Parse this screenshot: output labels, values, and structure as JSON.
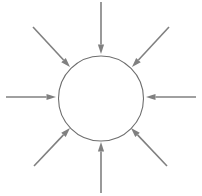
{
  "diagram": {
    "canvas": {
      "width": 202,
      "height": 196,
      "background": "#ffffff"
    },
    "colors": {
      "arrow": "#808080",
      "circle_stroke": "#6e6e6e",
      "background": "#ffffff"
    },
    "circle": {
      "label": "central circle",
      "cx": 101,
      "cy": 98.5,
      "r": 42.5,
      "stroke_width": 1.1,
      "fill": "none"
    },
    "arrow_count": 8,
    "arrows": [
      {
        "name": "arrow-north",
        "direction": "down",
        "compass": "N",
        "angle_deg": 90,
        "tail": {
          "x": 101,
          "y": 2
        },
        "tip": {
          "x": 101,
          "y": 54
        }
      },
      {
        "name": "arrow-northeast",
        "direction": "down-left",
        "compass": "NE",
        "angle_deg": 45,
        "tail": {
          "x": 169,
          "y": 27
        },
        "tip": {
          "x": 132,
          "y": 67
        }
      },
      {
        "name": "arrow-east",
        "direction": "left",
        "compass": "E",
        "angle_deg": 0,
        "tail": {
          "x": 196,
          "y": 97
        },
        "tip": {
          "x": 146,
          "y": 97
        }
      },
      {
        "name": "arrow-southeast",
        "direction": "up-left",
        "compass": "SE",
        "angle_deg": 315,
        "tail": {
          "x": 167,
          "y": 166
        },
        "tip": {
          "x": 131,
          "y": 128
        }
      },
      {
        "name": "arrow-south",
        "direction": "up",
        "compass": "S",
        "angle_deg": 270,
        "tail": {
          "x": 101,
          "y": 193
        },
        "tip": {
          "x": 101,
          "y": 142
        }
      },
      {
        "name": "arrow-southwest",
        "direction": "up-right",
        "compass": "SW",
        "angle_deg": 225,
        "tail": {
          "x": 34,
          "y": 166
        },
        "tip": {
          "x": 70,
          "y": 128
        }
      },
      {
        "name": "arrow-west",
        "direction": "right",
        "compass": "W",
        "angle_deg": 180,
        "tail": {
          "x": 6,
          "y": 97
        },
        "tip": {
          "x": 56,
          "y": 97
        }
      },
      {
        "name": "arrow-northwest",
        "direction": "down-right",
        "compass": "NW",
        "angle_deg": 135,
        "tail": {
          "x": 33,
          "y": 27
        },
        "tip": {
          "x": 70,
          "y": 67
        }
      }
    ]
  }
}
